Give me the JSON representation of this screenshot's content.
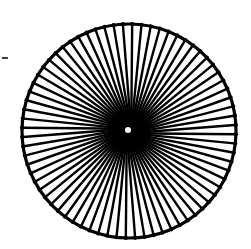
{
  "image": {
    "subject": "radial spoked wheel line drawing",
    "background_color": "#ffffff",
    "ink_color": "#000000"
  },
  "wheel": {
    "center_x": 129,
    "center_y": 131,
    "outer_radius": 107,
    "rim_width": 3.2,
    "spoke_count": 72,
    "spoke_width": 2.4,
    "hub_radius": 3
  },
  "artifact": {
    "x1": 2,
    "y1": 58,
    "x2": 8,
    "y2": 58
  }
}
